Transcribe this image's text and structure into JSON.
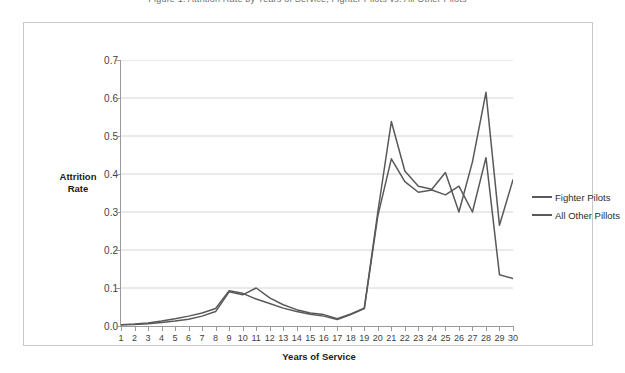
{
  "top_caption": "Figure 1. Attrition Rate by Years of Service, Fighter Pilots vs. All Other Pilots",
  "y_axis": {
    "title_line1": "Attrition",
    "title_line2": "Rate",
    "ticks": [
      "0.0",
      "0.1",
      "0.2",
      "0.3",
      "0.4",
      "0.5",
      "0.6",
      "0.7"
    ]
  },
  "x_axis": {
    "title": "Years of Service",
    "ticks": [
      "1",
      "2",
      "3",
      "4",
      "5",
      "6",
      "7",
      "8",
      "9",
      "10",
      "11",
      "12",
      "13",
      "14",
      "15",
      "16",
      "17",
      "18",
      "19",
      "20",
      "21",
      "22",
      "23",
      "24",
      "25",
      "26",
      "27",
      "28",
      "29",
      "30"
    ]
  },
  "legend": {
    "items": [
      {
        "label": "Fighter Pilots",
        "color": "#595959"
      },
      {
        "label": "All Other Pillots",
        "color": "#595959"
      }
    ]
  },
  "colors": {
    "series_line": "#595959",
    "gridline": "#d4d4d4",
    "axis": "#9a9a9a",
    "frame_border": "#c9c9c9",
    "plot_background": "#ffffff"
  },
  "chart_data": {
    "type": "line",
    "title": "",
    "xlabel": "Years of Service",
    "ylabel": "Attrition Rate",
    "x": [
      1,
      2,
      3,
      4,
      5,
      6,
      7,
      8,
      9,
      10,
      11,
      12,
      13,
      14,
      15,
      16,
      17,
      18,
      19,
      20,
      21,
      22,
      23,
      24,
      25,
      26,
      27,
      28,
      29,
      30
    ],
    "xlim": [
      1,
      30
    ],
    "ylim": [
      0.0,
      0.7
    ],
    "yticks": [
      0.0,
      0.1,
      0.2,
      0.3,
      0.4,
      0.5,
      0.6,
      0.7
    ],
    "grid": "horizontal",
    "legend_position": "right",
    "series": [
      {
        "name": "Fighter Pilots",
        "color": "#595959",
        "values": [
          0.003,
          0.004,
          0.006,
          0.009,
          0.013,
          0.018,
          0.026,
          0.038,
          0.09,
          0.082,
          0.1,
          0.074,
          0.056,
          0.043,
          0.034,
          0.03,
          0.019,
          0.032,
          0.047,
          0.3,
          0.538,
          0.408,
          0.368,
          0.36,
          0.404,
          0.3,
          0.432,
          0.615,
          0.265,
          0.385
        ]
      },
      {
        "name": "All Other Pillots",
        "color": "#595959",
        "values": [
          0.003,
          0.005,
          0.008,
          0.013,
          0.019,
          0.026,
          0.034,
          0.046,
          0.093,
          0.086,
          0.071,
          0.059,
          0.047,
          0.038,
          0.031,
          0.026,
          0.017,
          0.03,
          0.046,
          0.29,
          0.44,
          0.38,
          0.352,
          0.358,
          0.345,
          0.368,
          0.3,
          0.443,
          0.135,
          0.125
        ]
      }
    ]
  }
}
